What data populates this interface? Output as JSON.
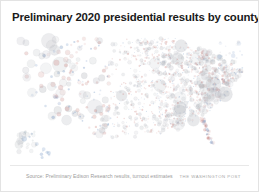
{
  "figure": {
    "background_color": "#ffffff",
    "border_color": "#e3e3e3"
  },
  "header": {
    "title": "Preliminary 2020 presidential results by county"
  },
  "footer": {
    "source_note": "Source: Preliminary Edison Research results, turnout estimates",
    "publisher_credit": "THE WASHINGTON POST"
  },
  "chart_data": {
    "type": "scatter",
    "title": "Preliminary 2020 presidential results by county",
    "subtitle": "",
    "xlabel": "",
    "ylabel": "",
    "projection": "albers-usa",
    "grid": false,
    "legend": "none",
    "annotations": [],
    "encoding": {
      "x": "county longitude (projected)",
      "y": "county latitude (projected)",
      "size": "county turnout / total votes cast",
      "color": "two-party margin (Democratic vs. Republican)"
    },
    "colors": {
      "democratic": "#5b82b8",
      "republican": "#c4736d",
      "neutral": "#b9bcc2",
      "outline": "#a7abb2"
    },
    "size_range_px": [
      0.6,
      7.5
    ],
    "opacity_range": [
      0.1,
      0.42
    ],
    "point_count_shown": 1180,
    "regions": [
      {
        "name": "Pacific Northwest",
        "density": "low",
        "dot_scale": "medium"
      },
      {
        "name": "California",
        "density": "low",
        "dot_scale": "large"
      },
      {
        "name": "Mountain West",
        "density": "very low",
        "dot_scale": "small"
      },
      {
        "name": "Great Plains",
        "density": "high",
        "dot_scale": "very small"
      },
      {
        "name": "Midwest",
        "density": "very high",
        "dot_scale": "small"
      },
      {
        "name": "Northeast corridor",
        "density": "very high",
        "dot_scale": "medium"
      },
      {
        "name": "Southeast",
        "density": "very high",
        "dot_scale": "small"
      },
      {
        "name": "Texas",
        "density": "high",
        "dot_scale": "small"
      },
      {
        "name": "Florida",
        "density": "medium",
        "dot_scale": "medium"
      }
    ]
  }
}
